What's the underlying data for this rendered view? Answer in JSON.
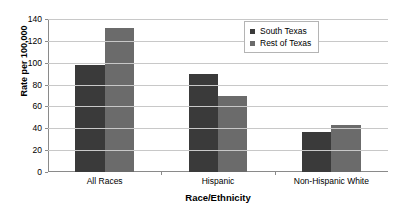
{
  "chart_data": {
    "type": "bar",
    "title": "",
    "subtitle": "",
    "xlabel": "Race/Ethnicity",
    "ylabel": "Rate per 100,000",
    "categories": [
      "All Races",
      "Hispanic",
      "Non-Hispanic White"
    ],
    "series": [
      {
        "name": "South Texas",
        "values": [
          98,
          90,
          37
        ],
        "color": "#3a3a3a"
      },
      {
        "name": "Rest of Texas",
        "values": [
          132,
          70,
          43
        ],
        "color": "#6b6b6b"
      }
    ],
    "ylim": [
      0,
      140
    ],
    "yticks": [
      0,
      20,
      40,
      60,
      80,
      100,
      120,
      140
    ],
    "ytick_labels": [
      "0",
      "20",
      "40",
      "60",
      "80",
      "100",
      "120",
      "140"
    ],
    "grid": true,
    "grid_axis": "y",
    "legend_position": "upper right",
    "plot_background": "#ffffff",
    "gridline_color": "#c8c8c8",
    "axis_color": "#8a8a8a"
  },
  "legend": {
    "entries": [
      {
        "label": "South Texas",
        "color": "#3a3a3a"
      },
      {
        "label": "Rest of Texas",
        "color": "#6b6b6b"
      }
    ]
  }
}
